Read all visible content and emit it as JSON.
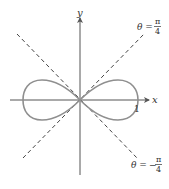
{
  "diagram": {
    "type": "polar-curve",
    "curve": "lemniscate",
    "axes": {
      "x_label": "x",
      "y_label": "y",
      "x_tick_label": "1"
    },
    "asymptote_lines": [
      {
        "theta_label": "θ = ",
        "fraction_num": "π",
        "fraction_den": "4",
        "sign": "",
        "style": "dashed"
      },
      {
        "theta_label": "θ = ",
        "fraction_num": "π",
        "fraction_den": "4",
        "sign": "−",
        "style": "dashed"
      }
    ],
    "colors": {
      "axis": "#555555",
      "curve": "#8a8a8a",
      "dashed": "#444444",
      "text": "#333333"
    }
  }
}
